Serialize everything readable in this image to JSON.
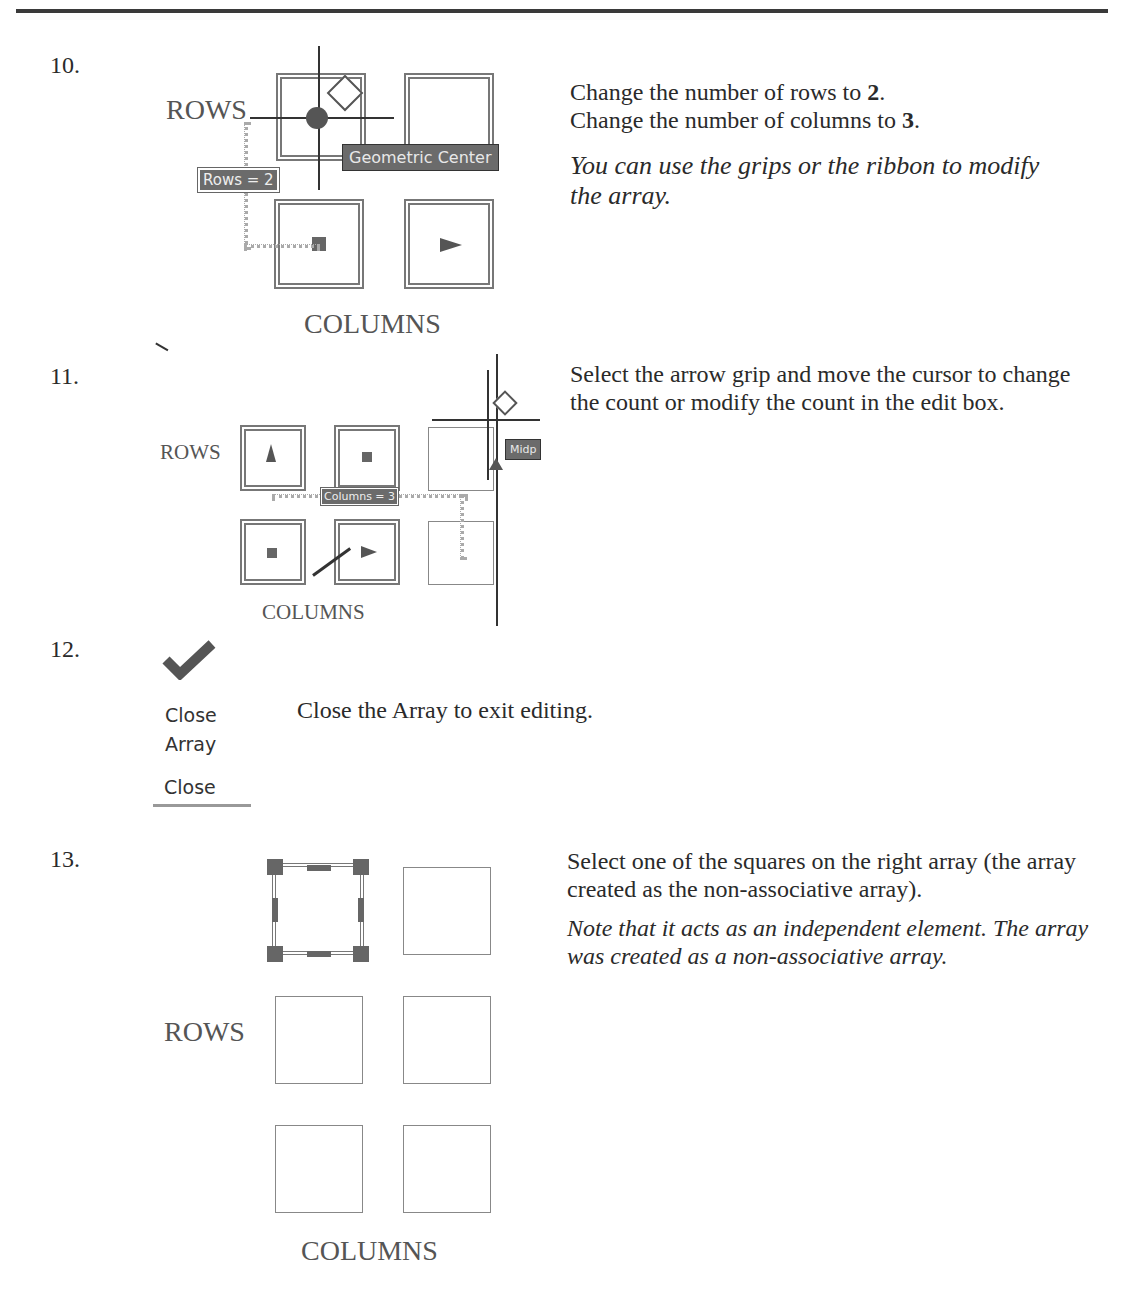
{
  "steps": [
    {
      "number": "10.",
      "text_line1_pre": "Change the number of rows to ",
      "text_line1_bold": "2",
      "text_line1_post": ".",
      "text_line2_pre": "Change the number of columns to ",
      "text_line2_bold": "3",
      "text_line2_post": ".",
      "note": "You can use the grips or the ribbon to modify the array.",
      "figure": {
        "rows_label": "ROWS",
        "columns_label": "COLUMNS",
        "edit_box": "Rows = 2",
        "tooltip": "Geometric Center"
      }
    },
    {
      "number": "11.",
      "text": "Select the arrow grip and move the cursor to change the count or modify the count in the edit box.",
      "figure": {
        "rows_label": "ROWS",
        "columns_label": "COLUMNS",
        "edit_box": "Columns = 3",
        "tooltip": "Midp"
      }
    },
    {
      "number": "12.",
      "text": "Close the Array to exit editing.",
      "figure": {
        "button_line1": "Close",
        "button_line2": "Array",
        "panel_label": "Close",
        "icon": "checkmark-icon"
      }
    },
    {
      "number": "13.",
      "text": "Select one of the squares on the right array (the array created as the non-associative array).",
      "note": "Note that it acts as an independent element. The array was created as a non-associative array.",
      "figure": {
        "rows_label": "ROWS",
        "columns_label": "COLUMNS"
      }
    }
  ]
}
